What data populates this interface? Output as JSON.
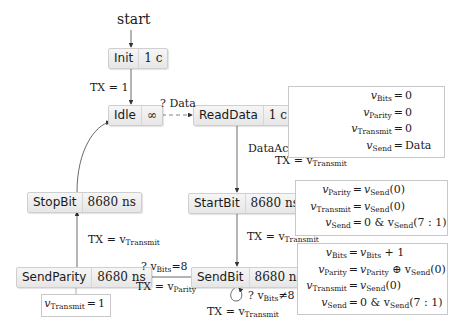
{
  "diagram": {
    "start_label": "start",
    "states": {
      "init": {
        "name": "Init",
        "duration": "1 c"
      },
      "idle": {
        "name": "Idle",
        "duration": "∞"
      },
      "read_data": {
        "name": "ReadData",
        "duration": "1 c"
      },
      "start_bit": {
        "name": "StartBit",
        "duration": "8680 ns"
      },
      "send_bit": {
        "name": "SendBit",
        "duration": "8680 ns"
      },
      "send_parity": {
        "name": "SendParity",
        "duration": "8680 ns"
      },
      "stop_bit": {
        "name": "StopBit",
        "duration": "8680 ns"
      }
    },
    "transitions": {
      "init_to_idle": "TX = 1",
      "idle_to_readdata": "? Data",
      "readdata_to_startbit_1": "DataAck = 1",
      "readdata_to_startbit_2_prefix": "TX = v",
      "readdata_to_startbit_2_sub": "Transmit",
      "startbit_to_sendbit_prefix": "TX = v",
      "startbit_to_sendbit_sub": "Transmit",
      "sendbit_loop_guard_prefix": "? v",
      "sendbit_loop_guard_sub": "Bits",
      "sendbit_loop_guard_suffix": "≠8",
      "sendbit_loop_action_prefix": "TX = v",
      "sendbit_loop_action_sub": "Transmit",
      "sendbit_to_sendparity_guard_prefix": "? v",
      "sendbit_to_sendparity_guard_sub": "Bits",
      "sendbit_to_sendparity_guard_suffix": "=8",
      "sendbit_to_sendparity_action_prefix": "TX = v",
      "sendbit_to_sendparity_action_sub": "Parity",
      "sendparity_to_stopbit_prefix": "TX = v",
      "sendparity_to_stopbit_sub": "Transmit"
    },
    "notes": {
      "read_data": [
        {
          "lhs": "v",
          "sub": "Bits",
          "rhs": "0"
        },
        {
          "lhs": "v",
          "sub": "Parity",
          "rhs": "0"
        },
        {
          "lhs": "v",
          "sub": "Transmit",
          "rhs": "0"
        },
        {
          "lhs": "v",
          "sub": "Send",
          "rhs": "Data"
        }
      ],
      "start_bit": [
        {
          "lhs": "v",
          "sub": "Parity",
          "rhs": "v",
          "rhs_sub": "Send",
          "rhs_tail": "(0)"
        },
        {
          "lhs": "v",
          "sub": "Transmit",
          "rhs": "v",
          "rhs_sub": "Send",
          "rhs_tail": "(0)"
        },
        {
          "lhs": "v",
          "sub": "Send",
          "rhs": "0 & v",
          "rhs_sub": "Send",
          "rhs_tail": "(7 : 1)"
        }
      ],
      "send_bit": [
        {
          "lhs": "v",
          "sub": "Bits",
          "rhs": "v",
          "rhs_sub": "Bits",
          "rhs_tail": " + 1"
        },
        {
          "lhs": "v",
          "sub": "Parity",
          "rhs": "v",
          "rhs_sub": "Parity",
          "rhs_tail": " ⊕ v",
          "rhs_sub2": "Send",
          "rhs_tail2": "(0)"
        },
        {
          "lhs": "v",
          "sub": "Transmit",
          "rhs": "v",
          "rhs_sub": "Send",
          "rhs_tail": "(0)"
        },
        {
          "lhs": "v",
          "sub": "Send",
          "rhs": "0 & v",
          "rhs_sub": "Send",
          "rhs_tail": "(7 : 1)"
        }
      ],
      "send_parity": [
        {
          "lhs": "v",
          "sub": "Transmit",
          "rhs": "1"
        }
      ]
    },
    "eq_sign": "="
  }
}
